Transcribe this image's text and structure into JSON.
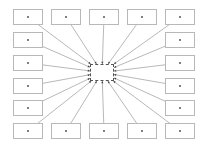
{
  "diagram": {
    "type": "hub-and-spoke",
    "colors": {
      "box_border": "#b8b8b8",
      "edge": "#888888",
      "dot": "#444444",
      "center_border": "#555555",
      "background": "#ffffff"
    },
    "center": {
      "x": 90,
      "y": 64,
      "w": 24,
      "h": 17
    },
    "box_size": {
      "w": 30,
      "h": 16
    },
    "nodes": [
      {
        "id": "n1",
        "x": 13,
        "y": 9
      },
      {
        "id": "n2",
        "x": 51,
        "y": 9
      },
      {
        "id": "n3",
        "x": 89,
        "y": 9
      },
      {
        "id": "n4",
        "x": 127,
        "y": 9
      },
      {
        "id": "n5",
        "x": 165,
        "y": 9
      },
      {
        "id": "n6",
        "x": 13,
        "y": 32
      },
      {
        "id": "n7",
        "x": 165,
        "y": 32
      },
      {
        "id": "n8",
        "x": 13,
        "y": 55
      },
      {
        "id": "n9",
        "x": 165,
        "y": 55
      },
      {
        "id": "n10",
        "x": 13,
        "y": 78
      },
      {
        "id": "n11",
        "x": 165,
        "y": 78
      },
      {
        "id": "n12",
        "x": 13,
        "y": 100
      },
      {
        "id": "n13",
        "x": 165,
        "y": 100
      },
      {
        "id": "n14",
        "x": 13,
        "y": 123
      },
      {
        "id": "n15",
        "x": 51,
        "y": 123
      },
      {
        "id": "n16",
        "x": 89,
        "y": 123
      },
      {
        "id": "n17",
        "x": 127,
        "y": 123
      },
      {
        "id": "n18",
        "x": 165,
        "y": 123
      }
    ]
  }
}
